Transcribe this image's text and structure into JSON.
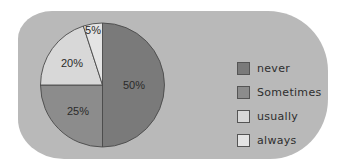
{
  "chart_data": {
    "type": "pie",
    "title": "",
    "categories": [
      "never",
      "sometimes",
      "usually",
      "always"
    ],
    "values": [
      50,
      25,
      20,
      5
    ],
    "labels": [
      "50%",
      "25%",
      "20%",
      "5%"
    ],
    "colors": [
      "#7a7a7a",
      "#8c8c8c",
      "#d8d8d8",
      "#e4e4e4"
    ],
    "legend_position": "right",
    "start_angle_deg": 0,
    "direction": "clockwise from 12 o'clock"
  },
  "legend": {
    "items": [
      {
        "label": "never",
        "color": "#7a7a7a"
      },
      {
        "label": "Sometimes",
        "color": "#8c8c8c"
      },
      {
        "label": "usually",
        "color": "#d8d8d8"
      },
      {
        "label": "always",
        "color": "#e4e4e4"
      }
    ]
  },
  "slice_labels": [
    "50%",
    "25%",
    "20%",
    "5%"
  ]
}
